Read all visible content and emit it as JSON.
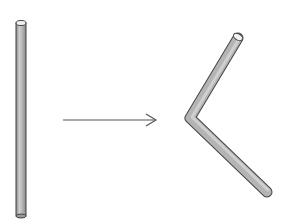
{
  "diagram": {
    "elements": [
      {
        "id": "straight-rod",
        "label": "",
        "shape": "cylinder"
      },
      {
        "id": "transform-arrow",
        "label": "",
        "direction": "right"
      },
      {
        "id": "bent-rod",
        "label": "",
        "shape": "bent-cylinder"
      }
    ],
    "colors": {
      "rod_fill": "#b4b4b4",
      "rod_highlight": "#d8d8d8",
      "rod_outline": "#444444",
      "arrow": "#555555",
      "background": "#ffffff"
    }
  }
}
